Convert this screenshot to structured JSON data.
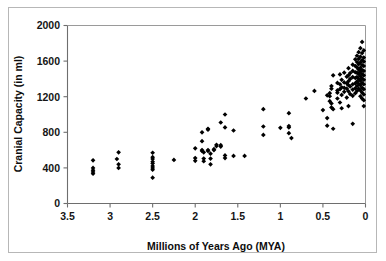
{
  "chart_data": {
    "type": "scatter",
    "title": "",
    "xlabel": "Millions of Years Ago (MYA)",
    "ylabel": "Cranial Capacity (in ml)",
    "xlim": [
      3.5,
      0
    ],
    "ylim": [
      0,
      2000
    ],
    "x_reversed": true,
    "grid": false,
    "legend": false,
    "xticks": [
      3.5,
      3,
      2.5,
      2,
      1.5,
      1,
      0.5,
      0
    ],
    "xtick_labels": [
      "3.5",
      "3",
      "2.5",
      "2",
      "1.5",
      "1",
      "0.5",
      "0"
    ],
    "yticks": [
      0,
      400,
      800,
      1200,
      1600,
      2000
    ],
    "ytick_labels": [
      "0",
      "400",
      "800",
      "1200",
      "1600",
      "2000"
    ],
    "marker": "diamond",
    "marker_color": "#000000",
    "series": [
      {
        "name": "Hominin cranial capacity",
        "points": [
          [
            3.2,
            485
          ],
          [
            3.2,
            400
          ],
          [
            3.2,
            375
          ],
          [
            3.2,
            355
          ],
          [
            3.2,
            335
          ],
          [
            2.92,
            500
          ],
          [
            2.9,
            575
          ],
          [
            2.9,
            440
          ],
          [
            2.9,
            400
          ],
          [
            2.5,
            570
          ],
          [
            2.5,
            520
          ],
          [
            2.5,
            500
          ],
          [
            2.5,
            470
          ],
          [
            2.5,
            450
          ],
          [
            2.5,
            420
          ],
          [
            2.5,
            400
          ],
          [
            2.5,
            380
          ],
          [
            2.5,
            290
          ],
          [
            2.25,
            490
          ],
          [
            2.0,
            620
          ],
          [
            2.0,
            510
          ],
          [
            2.0,
            480
          ],
          [
            1.92,
            800
          ],
          [
            1.92,
            700
          ],
          [
            1.92,
            600
          ],
          [
            1.92,
            590
          ],
          [
            1.9,
            575
          ],
          [
            1.9,
            505
          ],
          [
            1.9,
            475
          ],
          [
            1.85,
            840
          ],
          [
            1.85,
            830
          ],
          [
            1.85,
            600
          ],
          [
            1.85,
            590
          ],
          [
            1.82,
            560
          ],
          [
            1.82,
            505
          ],
          [
            1.82,
            440
          ],
          [
            1.78,
            610
          ],
          [
            1.78,
            600
          ],
          [
            1.75,
            660
          ],
          [
            1.75,
            645
          ],
          [
            1.7,
            910
          ],
          [
            1.7,
            655
          ],
          [
            1.7,
            640
          ],
          [
            1.65,
            1000
          ],
          [
            1.65,
            855
          ],
          [
            1.65,
            540
          ],
          [
            1.65,
            510
          ],
          [
            1.55,
            820
          ],
          [
            1.55,
            535
          ],
          [
            1.42,
            535
          ],
          [
            1.2,
            1060
          ],
          [
            1.2,
            865
          ],
          [
            1.2,
            770
          ],
          [
            1.0,
            850
          ],
          [
            0.9,
            1015
          ],
          [
            0.9,
            870
          ],
          [
            0.9,
            855
          ],
          [
            0.9,
            790
          ],
          [
            0.87,
            735
          ],
          [
            0.7,
            1180
          ],
          [
            0.6,
            1265
          ],
          [
            0.5,
            1050
          ],
          [
            0.45,
            1215
          ],
          [
            0.45,
            960
          ],
          [
            0.45,
            875
          ],
          [
            0.42,
            1240
          ],
          [
            0.42,
            1205
          ],
          [
            0.42,
            1150
          ],
          [
            0.4,
            1320
          ],
          [
            0.4,
            1290
          ],
          [
            0.4,
            1125
          ],
          [
            0.4,
            1080
          ],
          [
            0.38,
            1440
          ],
          [
            0.38,
            1060
          ],
          [
            0.38,
            840
          ],
          [
            0.33,
            1355
          ],
          [
            0.33,
            1270
          ],
          [
            0.33,
            1245
          ],
          [
            0.33,
            1180
          ],
          [
            0.3,
            1450
          ],
          [
            0.3,
            1340
          ],
          [
            0.3,
            1285
          ],
          [
            0.3,
            1135
          ],
          [
            0.28,
            1390
          ],
          [
            0.28,
            1305
          ],
          [
            0.28,
            1220
          ],
          [
            0.28,
            1070
          ],
          [
            0.25,
            1470
          ],
          [
            0.25,
            1360
          ],
          [
            0.25,
            1300
          ],
          [
            0.25,
            1255
          ],
          [
            0.22,
            1425
          ],
          [
            0.22,
            1350
          ],
          [
            0.22,
            1290
          ],
          [
            0.22,
            1190
          ],
          [
            0.2,
            1520
          ],
          [
            0.2,
            1440
          ],
          [
            0.2,
            1375
          ],
          [
            0.2,
            1330
          ],
          [
            0.2,
            1260
          ],
          [
            0.2,
            1095
          ],
          [
            0.18,
            1465
          ],
          [
            0.18,
            1400
          ],
          [
            0.18,
            1315
          ],
          [
            0.18,
            1230
          ],
          [
            0.15,
            1560
          ],
          [
            0.15,
            1490
          ],
          [
            0.15,
            1420
          ],
          [
            0.15,
            1340
          ],
          [
            0.15,
            1280
          ],
          [
            0.15,
            1210
          ],
          [
            0.15,
            895
          ],
          [
            0.12,
            1620
          ],
          [
            0.12,
            1545
          ],
          [
            0.12,
            1475
          ],
          [
            0.12,
            1410
          ],
          [
            0.12,
            1350
          ],
          [
            0.12,
            1295
          ],
          [
            0.12,
            1240
          ],
          [
            0.1,
            1660
          ],
          [
            0.1,
            1590
          ],
          [
            0.1,
            1530
          ],
          [
            0.1,
            1470
          ],
          [
            0.1,
            1420
          ],
          [
            0.1,
            1370
          ],
          [
            0.1,
            1320
          ],
          [
            0.1,
            1265
          ],
          [
            0.08,
            1700
          ],
          [
            0.08,
            1625
          ],
          [
            0.08,
            1565
          ],
          [
            0.08,
            1505
          ],
          [
            0.08,
            1455
          ],
          [
            0.08,
            1400
          ],
          [
            0.08,
            1345
          ],
          [
            0.08,
            1290
          ],
          [
            0.06,
            1745
          ],
          [
            0.06,
            1650
          ],
          [
            0.06,
            1585
          ],
          [
            0.06,
            1525
          ],
          [
            0.06,
            1480
          ],
          [
            0.06,
            1430
          ],
          [
            0.06,
            1380
          ],
          [
            0.06,
            1330
          ],
          [
            0.06,
            1270
          ],
          [
            0.06,
            1205
          ],
          [
            0.04,
            1815
          ],
          [
            0.04,
            1690
          ],
          [
            0.04,
            1610
          ],
          [
            0.04,
            1555
          ],
          [
            0.04,
            1500
          ],
          [
            0.04,
            1455
          ],
          [
            0.04,
            1405
          ],
          [
            0.04,
            1355
          ],
          [
            0.04,
            1300
          ],
          [
            0.04,
            1245
          ],
          [
            0.04,
            1180
          ],
          [
            0.02,
            1720
          ],
          [
            0.02,
            1640
          ],
          [
            0.02,
            1595
          ],
          [
            0.02,
            1545
          ],
          [
            0.02,
            1490
          ],
          [
            0.02,
            1440
          ],
          [
            0.02,
            1390
          ],
          [
            0.02,
            1340
          ],
          [
            0.02,
            1285
          ],
          [
            0.02,
            1225
          ],
          [
            0.02,
            1160
          ],
          [
            0.02,
            1095
          ]
        ]
      }
    ]
  }
}
